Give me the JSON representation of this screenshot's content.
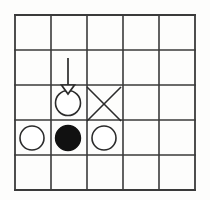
{
  "diagram": {
    "background_color": "#fdfdfc",
    "line_color": "#3a3a3a",
    "grid": {
      "rows": 5,
      "columns": 5,
      "left": 15,
      "top": 15,
      "cell_width": 36,
      "cell_height": 35,
      "line_width": 1.6,
      "border_width": 1.8
    },
    "stones": [
      {
        "name": "hollow-circle-target",
        "type": "white-stone",
        "fill": "#ffffff",
        "stroke": "#2b2b2b",
        "stroke_width": 1.6,
        "row": 3,
        "column": 2,
        "cx": 68,
        "cy": 103,
        "r": 12.5,
        "label": "placed white stone"
      },
      {
        "name": "white-stone-left",
        "type": "white-stone",
        "fill": "#ffffff",
        "stroke": "#2b2b2b",
        "stroke_width": 1.6,
        "row": 4,
        "column": 1,
        "cx": 32,
        "cy": 138,
        "r": 12,
        "label": "white stone"
      },
      {
        "name": "black-stone-center",
        "type": "black-stone",
        "fill": "#111111",
        "stroke": "#111111",
        "stroke_width": 1.4,
        "row": 4,
        "column": 2,
        "cx": 68,
        "cy": 138,
        "r": 12.5,
        "label": "black stone"
      },
      {
        "name": "white-stone-right",
        "type": "white-stone",
        "fill": "#ffffff",
        "stroke": "#2b2b2b",
        "stroke_width": 1.6,
        "row": 4,
        "column": 3,
        "cx": 104,
        "cy": 138,
        "r": 12,
        "label": "white stone"
      }
    ],
    "marks": [
      {
        "name": "x-mark",
        "type": "cross",
        "row": 3,
        "column": 3,
        "x1": 87,
        "y1": 87,
        "x2": 121,
        "y2": 121,
        "x3": 121,
        "y3": 87,
        "x4": 87,
        "y4": 121,
        "stroke": "#2b2b2b",
        "stroke_width": 1.6,
        "label": "capture marker"
      }
    ],
    "arrow": {
      "name": "move-arrow",
      "direction": "down",
      "stroke": "#2b2b2b",
      "stroke_width": 1.7,
      "shaft_x": 68,
      "shaft_y_start": 58,
      "shaft_y_end": 86,
      "head_left_x": 61.5,
      "head_right_x": 74.5,
      "head_top_y": 85,
      "head_tip_y": 94,
      "head_fill": "#ffffff",
      "label": "drop direction arrow"
    }
  }
}
